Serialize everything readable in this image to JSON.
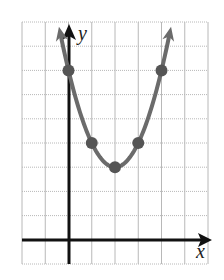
{
  "chart_data": {
    "type": "line",
    "title": "",
    "xlabel": "x",
    "ylabel": "y",
    "function": "y = (x - 2)^2 + 3",
    "x": [
      0,
      1,
      2,
      3,
      4
    ],
    "series": [
      {
        "name": "parabola",
        "values": [
          7,
          4,
          3,
          4,
          7
        ]
      }
    ],
    "points": [
      {
        "x": 0,
        "y": 7
      },
      {
        "x": 1,
        "y": 4
      },
      {
        "x": 2,
        "y": 3
      },
      {
        "x": 3,
        "y": 4
      },
      {
        "x": 4,
        "y": 7
      }
    ],
    "xlim": [
      -2,
      6
    ],
    "ylim": [
      -1,
      9
    ],
    "grid": true,
    "vertex": {
      "x": 2,
      "y": 3
    },
    "arrows_on_curve_ends": true
  },
  "labels": {
    "x_axis": "x",
    "y_axis": "y"
  },
  "colors": {
    "grid": "#b8b8b8",
    "axis": "#111111",
    "curve": "#6b6b6b",
    "point": "#555555"
  }
}
